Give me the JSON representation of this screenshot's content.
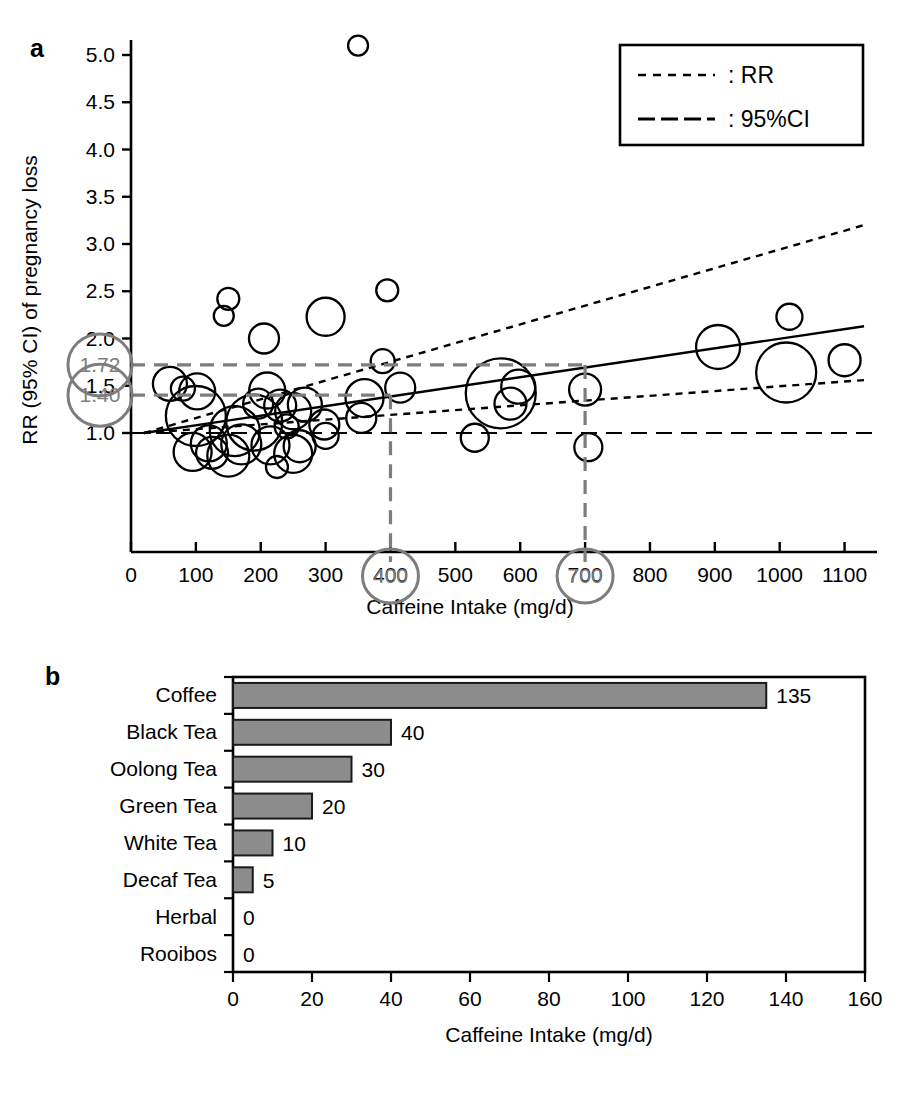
{
  "figure": {
    "panel_a_letter": "a",
    "panel_b_letter": "b"
  },
  "panel_a": {
    "ylabel": "RR (95% CI) of pregnancy loss",
    "xlabel": "Caffeine Intake (mg/d)",
    "legend": {
      "rr_label": ": RR",
      "ci_label": ": 95%CI"
    },
    "annotations": {
      "rr_upper": "1.72",
      "rr_lower": "1.40",
      "x_mark_1": "400",
      "x_mark_2": "700"
    },
    "ytick_labels": [
      "1.0",
      "1.5",
      "2.0",
      "2.5",
      "3.0",
      "3.5",
      "4.0",
      "4.5",
      "5.0"
    ],
    "xtick_labels": [
      "0",
      "100",
      "200",
      "300",
      "400",
      "500",
      "600",
      "700",
      "800",
      "900",
      "1000",
      "1100"
    ]
  },
  "panel_b": {
    "xlabel": "Caffeine Intake (mg/d)",
    "xtick_labels": [
      "0",
      "20",
      "40",
      "60",
      "80",
      "100",
      "120",
      "140",
      "160"
    ]
  },
  "colors": {
    "bar_fill": "#8c8c8c",
    "bar_stroke": "#1a1a1a",
    "annotation_gray": "#7d7d7d",
    "axis": "#000000",
    "bubble_stroke": "#000000"
  },
  "chart_data": [
    {
      "type": "scatter",
      "panel": "a",
      "title": "",
      "xlabel": "Caffeine Intake (mg/d)",
      "ylabel": "RR (95% CI) of pregnancy loss",
      "xlim": [
        0,
        1150
      ],
      "ylim": [
        0.35,
        5.3
      ],
      "xticks": [
        0,
        100,
        200,
        300,
        400,
        500,
        600,
        700,
        800,
        900,
        1000,
        1100
      ],
      "yticks": [
        1.0,
        1.5,
        2.0,
        2.5,
        3.0,
        3.5,
        4.0,
        4.5,
        5.0
      ],
      "grid": false,
      "legend_position": "top-right",
      "legend_entries": [
        {
          "label": ": RR",
          "style": "short-dash"
        },
        {
          "label": ": 95%CI",
          "style": "long-dash"
        }
      ],
      "bubbles": [
        {
          "x": 350,
          "y": 5.1,
          "r": 10
        },
        {
          "x": 150,
          "y": 2.42,
          "r": 11
        },
        {
          "x": 143,
          "y": 2.24,
          "r": 10
        },
        {
          "x": 205,
          "y": 2.0,
          "r": 15
        },
        {
          "x": 300,
          "y": 2.23,
          "r": 19
        },
        {
          "x": 395,
          "y": 2.51,
          "r": 11
        },
        {
          "x": 388,
          "y": 1.76,
          "r": 12
        },
        {
          "x": 60,
          "y": 1.52,
          "r": 17
        },
        {
          "x": 80,
          "y": 1.47,
          "r": 12
        },
        {
          "x": 102,
          "y": 1.44,
          "r": 18
        },
        {
          "x": 415,
          "y": 1.48,
          "r": 15
        },
        {
          "x": 700,
          "y": 1.46,
          "r": 16
        },
        {
          "x": 905,
          "y": 1.91,
          "r": 22
        },
        {
          "x": 1015,
          "y": 2.23,
          "r": 13
        },
        {
          "x": 1010,
          "y": 1.64,
          "r": 30
        },
        {
          "x": 1100,
          "y": 1.77,
          "r": 16
        },
        {
          "x": 570,
          "y": 1.42,
          "r": 35
        },
        {
          "x": 597,
          "y": 1.49,
          "r": 17
        },
        {
          "x": 585,
          "y": 1.31,
          "r": 16
        },
        {
          "x": 210,
          "y": 1.45,
          "r": 18
        },
        {
          "x": 196,
          "y": 1.31,
          "r": 15
        },
        {
          "x": 230,
          "y": 1.29,
          "r": 16
        },
        {
          "x": 268,
          "y": 1.3,
          "r": 17
        },
        {
          "x": 250,
          "y": 1.23,
          "r": 18
        },
        {
          "x": 100,
          "y": 1.18,
          "r": 30
        },
        {
          "x": 190,
          "y": 1.11,
          "r": 28
        },
        {
          "x": 160,
          "y": 1.02,
          "r": 25
        },
        {
          "x": 240,
          "y": 1.07,
          "r": 12
        },
        {
          "x": 298,
          "y": 1.09,
          "r": 15
        },
        {
          "x": 360,
          "y": 1.37,
          "r": 19
        },
        {
          "x": 355,
          "y": 1.16,
          "r": 15
        },
        {
          "x": 300,
          "y": 0.97,
          "r": 13
        },
        {
          "x": 120,
          "y": 0.89,
          "r": 18
        },
        {
          "x": 170,
          "y": 0.88,
          "r": 20
        },
        {
          "x": 215,
          "y": 0.87,
          "r": 19
        },
        {
          "x": 260,
          "y": 0.86,
          "r": 16
        },
        {
          "x": 95,
          "y": 0.8,
          "r": 19
        },
        {
          "x": 150,
          "y": 0.76,
          "r": 21
        },
        {
          "x": 125,
          "y": 0.79,
          "r": 16
        },
        {
          "x": 250,
          "y": 0.78,
          "r": 19
        },
        {
          "x": 225,
          "y": 0.64,
          "r": 11
        },
        {
          "x": 530,
          "y": 0.95,
          "r": 14
        },
        {
          "x": 705,
          "y": 0.85,
          "r": 14
        }
      ],
      "fit_line": {
        "x": [
          20,
          1130
        ],
        "y": [
          1.0,
          2.13
        ],
        "style": "solid"
      },
      "ci_upper": {
        "x": [
          20,
          1130
        ],
        "y": [
          1.0,
          3.2
        ],
        "style": "short-dash"
      },
      "ci_lower": {
        "x": [
          20,
          1130
        ],
        "y": [
          1.0,
          1.56
        ],
        "style": "short-dash"
      },
      "reference_line": {
        "y": 1.0,
        "style": "long-dash"
      },
      "guide_lines": [
        {
          "y": 1.72,
          "x_to": 700,
          "style": "long-dash",
          "color": "#7d7d7d"
        },
        {
          "y": 1.4,
          "x_to": 400,
          "style": "long-dash",
          "color": "#7d7d7d"
        },
        {
          "x": 400,
          "y_to": 1.4,
          "style": "long-dash",
          "color": "#7d7d7d"
        },
        {
          "x": 700,
          "y_to": 1.72,
          "style": "long-dash",
          "color": "#7d7d7d"
        }
      ]
    },
    {
      "type": "bar",
      "panel": "b",
      "orientation": "horizontal",
      "title": "",
      "xlabel": "Caffeine Intake (mg/d)",
      "ylabel": "",
      "categories": [
        "Coffee",
        "Black Tea",
        "Oolong Tea",
        "Green Tea",
        "White Tea",
        "Decaf Tea",
        "Herbal",
        "Rooibos"
      ],
      "values": [
        135,
        40,
        30,
        20,
        10,
        5,
        0,
        0
      ],
      "value_labels": [
        "135",
        "40",
        "30",
        "20",
        "10",
        "5",
        "0",
        "0"
      ],
      "xlim": [
        0,
        160
      ],
      "xticks": [
        0,
        20,
        40,
        60,
        80,
        100,
        120,
        140,
        160
      ],
      "grid": false
    }
  ]
}
